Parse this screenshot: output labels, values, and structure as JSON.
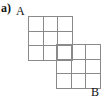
{
  "figure": {
    "part_label": "a)",
    "point_a_label": "A",
    "point_b_label": "B",
    "line_color": "#8a8a8a",
    "background_color": "#ffffff",
    "text_color": "#111111",
    "blocks": [
      {
        "name": "upper-left-block",
        "rows": 3,
        "cols": 3,
        "x": 28,
        "y": 16,
        "width": 44,
        "height": 44,
        "cell_count": 9
      },
      {
        "name": "lower-right-block",
        "rows": 3,
        "cols": 3,
        "x": 56,
        "y": 44,
        "width": 44,
        "height": 44,
        "cell_count": 9
      }
    ],
    "cells_upper": [
      1,
      2,
      3,
      4,
      5,
      6,
      7,
      8,
      9
    ],
    "cells_lower": [
      1,
      2,
      3,
      4,
      5,
      6,
      7,
      8,
      9
    ]
  }
}
